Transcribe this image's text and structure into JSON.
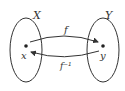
{
  "diagram": {
    "sets": [
      {
        "name": "X",
        "element": "x"
      },
      {
        "name": "Y",
        "element": "y"
      }
    ],
    "arrows": [
      {
        "label": "f",
        "from": "x",
        "to": "y"
      },
      {
        "label": "f⁻¹",
        "from": "y",
        "to": "x"
      }
    ],
    "colors": {
      "stroke": "#333333",
      "background": "#ffffff"
    }
  }
}
